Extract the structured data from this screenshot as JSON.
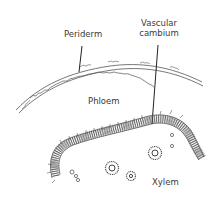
{
  "diagram": {
    "labels": {
      "periderm": "Periderm",
      "vascular_cambium_line1": "Vascular",
      "vascular_cambium_line2": "cambium",
      "phloem": "Phloem",
      "xylem": "Xylem"
    },
    "colors": {
      "line": "#4a4a4a",
      "text": "#3a3a3a",
      "background": "#ffffff"
    }
  }
}
